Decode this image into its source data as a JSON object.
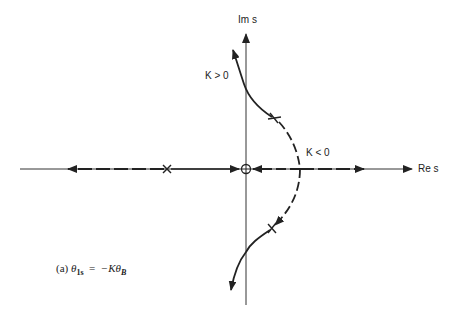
{
  "diagram": {
    "type": "root-locus",
    "axes": {
      "imag_label": "Im s",
      "real_label": "Re s"
    },
    "branch_labels": {
      "positive_gain": "K > 0",
      "negative_gain": "K < 0"
    },
    "caption": {
      "prefix": "(a)",
      "lhs_symbol": "θ",
      "lhs_subscript": "1s",
      "equals": "=",
      "rhs_prefix": "−Kθ",
      "rhs_subscript": "B"
    },
    "markers": {
      "poles": [
        "real-axis pole (left half-plane)",
        "complex pole (upper)",
        "complex pole (lower)"
      ],
      "zeros": [
        "zero at origin"
      ]
    },
    "colors": {
      "line": "#222222",
      "background": "#ffffff"
    }
  }
}
